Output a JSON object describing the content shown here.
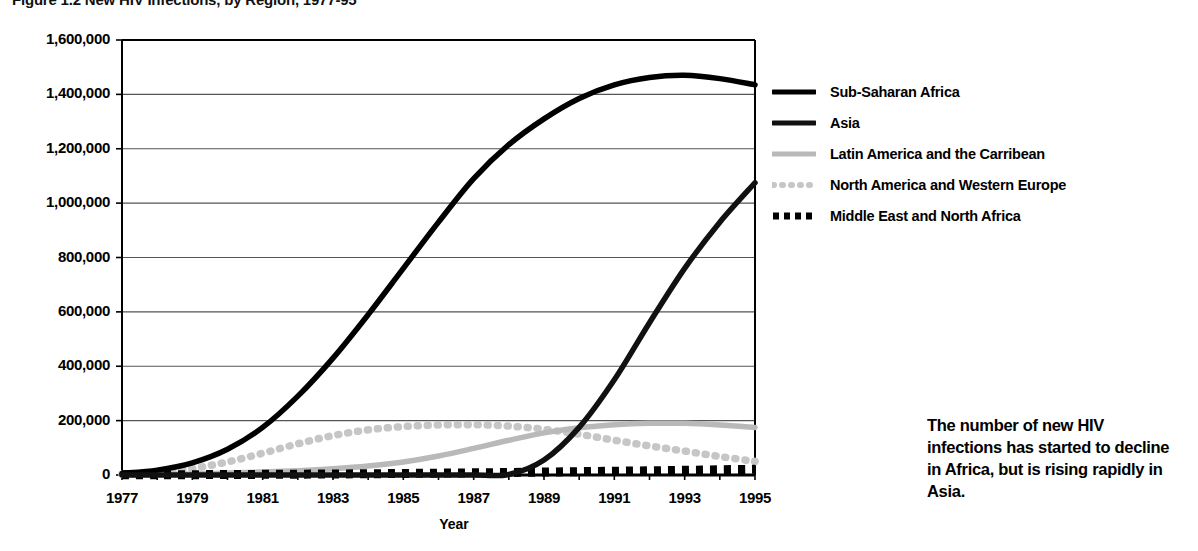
{
  "figure": {
    "title": "Figure 1.2  New HIV Infections, by Region, 1977-95",
    "callout": "The number of new HIV infections has started to decline in Africa, but is rising rapidly in Asia."
  },
  "axes": {
    "xlabel": "Year",
    "ylabel": "",
    "ytick_labels": [
      "1,600,000",
      "1,400,000",
      "1,200,000",
      "1,000,000",
      "800,000",
      "600,000",
      "400,000",
      "200,000",
      "0"
    ],
    "xtick_labels": [
      "1977",
      "1979",
      "1981",
      "1983",
      "1985",
      "1987",
      "1989",
      "1991",
      "1993",
      "1995"
    ]
  },
  "legend": {
    "items": [
      {
        "label": "Sub-Saharan Africa",
        "style": "solid-thick",
        "color": "#000000"
      },
      {
        "label": "Asia",
        "style": "solid-thick",
        "color": "#111111"
      },
      {
        "label": "Latin America and the Carribean",
        "style": "solid-thick",
        "color": "#b9b9b9"
      },
      {
        "label": "North America and Western Europe",
        "style": "dotted",
        "color": "#c6c6c6"
      },
      {
        "label": "Middle East and North Africa",
        "style": "dashed",
        "color": "#000000"
      }
    ]
  },
  "chart_data": {
    "type": "line",
    "title": "Figure 1.2  New HIV Infections, by Region, 1977-95",
    "xlabel": "Year",
    "ylabel": "New HIV infections",
    "xlim": [
      1977,
      1995
    ],
    "ylim": [
      0,
      1600000
    ],
    "ytick_values": [
      0,
      200000,
      400000,
      600000,
      800000,
      1000000,
      1200000,
      1400000,
      1600000
    ],
    "grid": "horizontal",
    "legend_position": "right",
    "x": [
      1977,
      1978,
      1979,
      1980,
      1981,
      1982,
      1983,
      1984,
      1985,
      1986,
      1987,
      1988,
      1989,
      1990,
      1991,
      1992,
      1993,
      1994,
      1995
    ],
    "series": [
      {
        "name": "Sub-Saharan Africa",
        "color": "#000000",
        "style": "solid-thick",
        "values": [
          6000,
          18000,
          45000,
          95000,
          175000,
          290000,
          430000,
          590000,
          760000,
          930000,
          1090000,
          1215000,
          1310000,
          1385000,
          1435000,
          1462000,
          1470000,
          1458000,
          1435000
        ]
      },
      {
        "name": "Asia",
        "color": "#111111",
        "style": "solid-thick",
        "values": [
          0,
          0,
          0,
          0,
          0,
          0,
          0,
          0,
          0,
          0,
          0,
          2000,
          55000,
          175000,
          350000,
          560000,
          760000,
          930000,
          1075000
        ]
      },
      {
        "name": "Latin America and the Carribean",
        "color": "#b9b9b9",
        "style": "solid-thick",
        "values": [
          1000,
          2000,
          4000,
          7000,
          11000,
          16000,
          23000,
          33000,
          48000,
          70000,
          98000,
          128000,
          155000,
          174000,
          185000,
          190000,
          190000,
          184000,
          175000
        ]
      },
      {
        "name": "North America and Western Europe",
        "color": "#c6c6c6",
        "style": "dotted",
        "values": [
          3000,
          10000,
          24000,
          48000,
          80000,
          115000,
          145000,
          166000,
          178000,
          184000,
          185000,
          180000,
          168000,
          150000,
          128000,
          107000,
          88000,
          68000,
          50000
        ]
      },
      {
        "name": "Middle East and North Africa",
        "color": "#000000",
        "style": "dashed",
        "values": [
          500,
          800,
          1200,
          1700,
          2300,
          3000,
          3800,
          4700,
          5700,
          6800,
          8000,
          9300,
          10700,
          12200,
          13800,
          15500,
          17300,
          19200,
          21000
        ]
      }
    ],
    "annotations": [
      {
        "text": "The number of new HIV infections has started to decline in Africa, but is rising rapidly in Asia.",
        "position": "right-lower"
      }
    ]
  }
}
